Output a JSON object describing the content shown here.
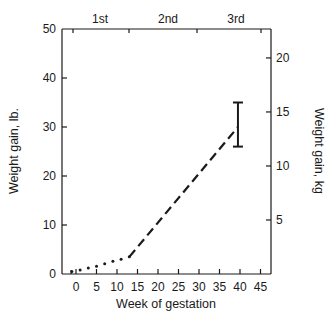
{
  "chart_data": {
    "type": "line",
    "title": "",
    "xlabel": "Week of gestation",
    "ylabel": "Weight gain, lb.",
    "y2label": "Weight gain, kg",
    "xlim": [
      -3,
      47
    ],
    "ylim": [
      0,
      50
    ],
    "y2lim": [
      0,
      22.7
    ],
    "x_ticks": [
      0,
      5,
      10,
      15,
      20,
      25,
      30,
      35,
      40,
      45
    ],
    "y_ticks": [
      0,
      10,
      20,
      30,
      40,
      50
    ],
    "y2_ticks": [
      5,
      10,
      15,
      20
    ],
    "top_axis_labels": [
      "1st",
      "2nd",
      "3rd"
    ],
    "grid": false,
    "series": [
      {
        "name": "First trimester (dotted)",
        "style": "dotted",
        "x": [
          -1,
          1,
          3,
          5,
          7,
          9,
          11,
          13
        ],
        "y": [
          0.5,
          0.8,
          1.2,
          1.6,
          2.1,
          2.6,
          3.0,
          3.5
        ]
      },
      {
        "name": "Second/third trimester (dashed)",
        "style": "dashed",
        "x": [
          13,
          39.5
        ],
        "y": [
          3.5,
          30
        ]
      }
    ],
    "error_bar": {
      "x": 39.5,
      "center": 30,
      "low": 26,
      "high": 35
    }
  },
  "labels": {
    "x_title": "Week of gestation",
    "y_title": "Weight gain, lb.",
    "y2_title": "Weight gain, kg",
    "trimesters": [
      "1st",
      "2nd",
      "3rd"
    ],
    "x_ticks": [
      "0",
      "5",
      "10",
      "15",
      "20",
      "25",
      "30",
      "35",
      "40",
      "45"
    ],
    "y_ticks": [
      "0",
      "10",
      "20",
      "30",
      "40",
      "50"
    ],
    "y2_ticks": [
      "5",
      "10",
      "15",
      "20"
    ]
  }
}
